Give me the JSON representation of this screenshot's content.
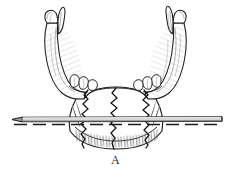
{
  "figure": {
    "caption": "A",
    "background_color": "#ffffff",
    "ink_color": "#1a1a1a",
    "shading_color": "#7d7d7d",
    "parts": [
      {
        "id": "left-condyle",
        "label": "Left condylar process"
      },
      {
        "id": "left-coronoid",
        "label": "Left coronoid process"
      },
      {
        "id": "left-ramus",
        "label": "Left ramus"
      },
      {
        "id": "left-molars",
        "label": "Left molar teeth"
      },
      {
        "id": "right-condyle",
        "label": "Right condylar process"
      },
      {
        "id": "right-coronoid",
        "label": "Right coronoid process"
      },
      {
        "id": "right-ramus",
        "label": "Right ramus"
      },
      {
        "id": "right-molars",
        "label": "Right molar teeth"
      },
      {
        "id": "mandible-body",
        "label": "Body of mandible"
      },
      {
        "id": "symphysis",
        "label": "Symphysis menti"
      },
      {
        "id": "lower-border",
        "label": "Inferior border"
      }
    ],
    "fracture_lines": [
      {
        "id": "fracture-left",
        "style": "zigzag",
        "x": 83
      },
      {
        "id": "fracture-center",
        "style": "zigzag",
        "x": 116
      },
      {
        "id": "fracture-right",
        "style": "zigzag",
        "x": 148
      }
    ],
    "fixation_rod": {
      "id": "transverse-rod",
      "label": "Transverse fixation pin",
      "x_start": 12,
      "x_end": 222,
      "y": 119,
      "left_tip": "pointed",
      "right_tip": "blunt"
    },
    "reference_line": {
      "id": "dashed-axis",
      "style": "dashed",
      "y": 124
    }
  }
}
